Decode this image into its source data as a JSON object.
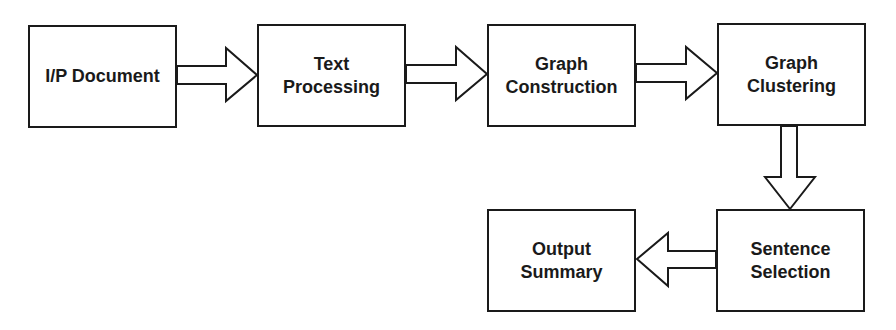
{
  "diagram": {
    "type": "flowchart",
    "colors": {
      "stroke": "#1a1a1a",
      "fill": "#ffffff",
      "text": "#1a1a1a"
    },
    "nodes": [
      {
        "id": "input",
        "label": "I/P Document",
        "x": 28,
        "y": 25,
        "w": 149,
        "h": 103
      },
      {
        "id": "text-processing",
        "label": "Text\nProcessing",
        "x": 257,
        "y": 24,
        "w": 149,
        "h": 103
      },
      {
        "id": "graph-construction",
        "label": "Graph\nConstruction",
        "x": 487,
        "y": 24,
        "w": 149,
        "h": 103
      },
      {
        "id": "graph-clustering",
        "label": "Graph\nClustering",
        "x": 717,
        "y": 23,
        "w": 149,
        "h": 103
      },
      {
        "id": "sentence-selection",
        "label": "Sentence\nSelection",
        "x": 716,
        "y": 209,
        "w": 149,
        "h": 103
      },
      {
        "id": "output-summary",
        "label": "Output\nSummary",
        "x": 487,
        "y": 209,
        "w": 149,
        "h": 103
      }
    ],
    "edges": [
      {
        "from": "input",
        "to": "text-processing",
        "direction": "right"
      },
      {
        "from": "text-processing",
        "to": "graph-construction",
        "direction": "right"
      },
      {
        "from": "graph-construction",
        "to": "graph-clustering",
        "direction": "right"
      },
      {
        "from": "graph-clustering",
        "to": "sentence-selection",
        "direction": "down"
      },
      {
        "from": "sentence-selection",
        "to": "output-summary",
        "direction": "left"
      }
    ]
  }
}
